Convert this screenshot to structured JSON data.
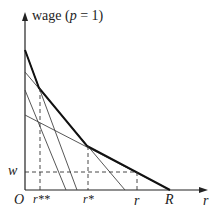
{
  "diagram": {
    "y_axis_label": "wage (",
    "y_axis_param": "p",
    "y_axis_suffix": " = 1)",
    "x_axis_label": "r",
    "origin_label": "O",
    "w_label": "w",
    "x_ticks": [
      {
        "label": "r**",
        "x": 40
      },
      {
        "label": "r*",
        "x": 88
      },
      {
        "label": "r",
        "x": 137
      },
      {
        "label": "R",
        "x": 170
      }
    ],
    "colors": {
      "line": "#222222",
      "axis": "#222222"
    }
  }
}
